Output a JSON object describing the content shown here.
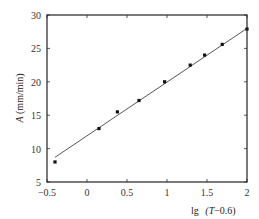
{
  "chart_data": {
    "type": "scatter",
    "title": "",
    "xlabel": "lg (T−0.6)",
    "ylabel": "A (mm/min)",
    "xlim": [
      -0.5,
      2
    ],
    "ylim": [
      5,
      30
    ],
    "xticks": [
      -0.5,
      0,
      0.5,
      1,
      1.5,
      2
    ],
    "xtick_labels": [
      "−0.5",
      "0",
      "0.5",
      "1",
      "1.5",
      "2"
    ],
    "yticks": [
      5,
      10,
      15,
      20,
      25,
      30
    ],
    "ytick_labels": [
      "5",
      "10",
      "15",
      "20",
      "25",
      "30"
    ],
    "grid": false,
    "legend": null,
    "series": [
      {
        "name": "measured",
        "type": "scatter",
        "x": [
          -0.4,
          0.15,
          0.38,
          0.65,
          0.97,
          1.29,
          1.47,
          1.69,
          2.0
        ],
        "y": [
          8.0,
          13.0,
          15.5,
          17.2,
          20.0,
          22.5,
          24.0,
          25.6,
          27.9
        ]
      },
      {
        "name": "linear fit",
        "type": "line",
        "x": [
          -0.4,
          2.0
        ],
        "y": [
          8.7,
          28.0
        ]
      }
    ]
  },
  "labels": {
    "x_axis_title_prefix": "lg",
    "x_axis_title_body": "(T−0.6)",
    "y_axis_title_italic": "A",
    "y_axis_title_units": " (mm/min)"
  }
}
